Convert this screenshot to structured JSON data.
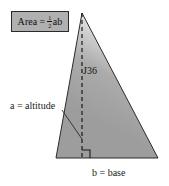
{
  "figure": {
    "name": "triangle-area-diagram",
    "formula_box": {
      "lhs": "Area",
      "equals": "=",
      "fraction_numerator": "1",
      "fraction_denominator": "2",
      "trailing": "ab",
      "fill_color": "#b0b0b0",
      "border_color": "#2a2a2a"
    },
    "reference_label": "J36",
    "altitude_label": "a = altitude",
    "base_label": "b = base",
    "colors": {
      "background": "#ffffff",
      "triangle_fill_dark": "#a2a2a2",
      "triangle_fill_light": "#f2f2f2",
      "triangle_outline": "#2b2b2b",
      "dashed_line": "#1a1a1a",
      "leader_line": "#2b2b2b",
      "text": "#1a1a1a"
    },
    "geometry": {
      "apex": "82,13",
      "bottom_left": "56,158",
      "bottom_right": "158,158",
      "altitude_foot": "82,158",
      "right_angle_marker": "present"
    }
  }
}
